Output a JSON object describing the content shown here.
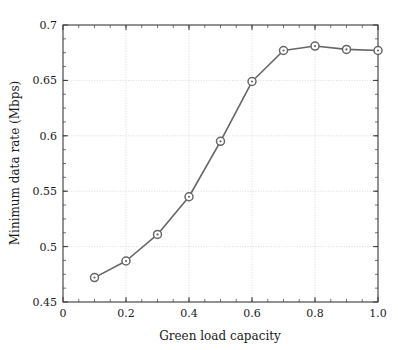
{
  "chart_data": {
    "type": "line",
    "title": "",
    "subtitle": "",
    "xlabel": "Green load capacity",
    "ylabel": "Minimum data rate (Mbps)",
    "x": [
      0.1,
      0.2,
      0.3,
      0.4,
      0.5,
      0.6,
      0.7,
      0.8,
      0.9,
      1.0
    ],
    "values": [
      0.472,
      0.487,
      0.511,
      0.545,
      0.595,
      0.649,
      0.677,
      0.681,
      0.678,
      0.677
    ],
    "series": [
      {
        "name": "Minimum data rate",
        "values": [
          0.472,
          0.487,
          0.511,
          0.545,
          0.595,
          0.649,
          0.677,
          0.681,
          0.678,
          0.677
        ]
      }
    ],
    "xlim": [
      0.0,
      1.0
    ],
    "ylim": [
      0.45,
      0.7
    ],
    "xticks": [
      0.0,
      0.2,
      0.4,
      0.6,
      0.8,
      1.0
    ],
    "xtick_labels": [
      "0",
      "0.2",
      "0.4",
      "0.6",
      "0.8",
      "1.0"
    ],
    "xminor_step": 0.05,
    "yticks": [
      0.45,
      0.5,
      0.55,
      0.6,
      0.65,
      0.7
    ],
    "ytick_labels": [
      "0.45",
      "0.5",
      "0.55",
      "0.6",
      "0.65",
      "0.7"
    ],
    "yminor_step": 0.0125,
    "grid": true,
    "grid_style": "dotted",
    "legend": null,
    "legend_position": "none",
    "annotations": [],
    "line_color": "#666666",
    "marker": "circle-dot",
    "marker_color": "#666666",
    "grid_color": "#cccccc",
    "axis_color": "#3a3a3a",
    "background": "#ffffff"
  }
}
